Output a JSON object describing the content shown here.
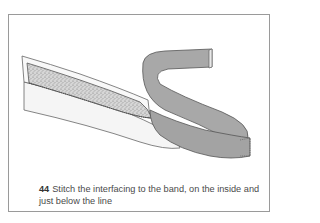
{
  "figure": {
    "number": "44",
    "caption": "Stitch the interfacing to the band, on the inside and just below the line",
    "illustration": "band-with-interfacing-illustration",
    "colors": {
      "border": "#9a9a9a",
      "band_outer": "#a8a8a8",
      "band_inner": "#f4f4f4",
      "interfacing": "#cfcfcf",
      "text": "#4a4a4a"
    }
  }
}
